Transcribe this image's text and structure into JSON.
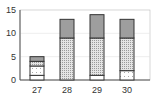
{
  "chart_data": {
    "type": "bar",
    "stacked": true,
    "title": "",
    "xlabel": "",
    "ylabel": "",
    "ylim": [
      0,
      15
    ],
    "yticks": [
      "0",
      "5",
      "10",
      "15"
    ],
    "categories": [
      "27",
      "28",
      "29",
      "30"
    ],
    "grid": true,
    "legend": null,
    "series": [
      {
        "name": "segment-1-white",
        "pattern": "white",
        "values": [
          1,
          0,
          1,
          0
        ]
      },
      {
        "name": "segment-2-sparse-dots",
        "pattern": "sparse-dots",
        "values": [
          2,
          0,
          0,
          2
        ]
      },
      {
        "name": "segment-3-dense-dots",
        "pattern": "dense-dots",
        "values": [
          1,
          9,
          8,
          7
        ]
      },
      {
        "name": "segment-4-gray",
        "pattern": "gray",
        "values": [
          1,
          4,
          5,
          4
        ]
      }
    ],
    "totals": [
      5,
      13,
      14,
      13
    ]
  }
}
